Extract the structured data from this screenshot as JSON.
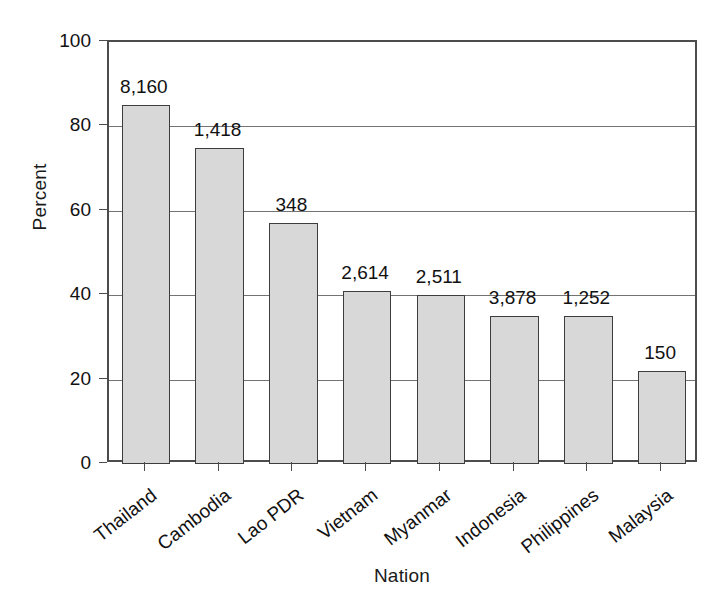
{
  "chart_data": {
    "type": "bar",
    "title": "",
    "subtitle": "",
    "xlabel": "Nation",
    "ylabel": "Percent",
    "categories": [
      "Thailand",
      "Cambodia",
      "Lao PDR",
      "Vietnam",
      "Myanmar",
      "Indonesia",
      "Philippines",
      "Malaysia"
    ],
    "values": [
      85,
      75,
      57,
      41,
      40,
      35,
      35,
      22
    ],
    "point_labels": [
      "8,160",
      "1,418",
      "348",
      "2,614",
      "2,511",
      "3,878",
      "1,252",
      "150"
    ],
    "ylim": [
      0,
      100
    ],
    "yticks": [
      0,
      20,
      40,
      60,
      80,
      100
    ],
    "ytick_labels": [
      "0",
      "20",
      "40",
      "60",
      "80",
      "100"
    ],
    "grid": "horizontal",
    "legend": "none",
    "bar_fill_color": "#d8d8d8",
    "bar_edge_color": "#3d3d3d",
    "grid_color": "#737373",
    "axis_color": "#4c4c4c",
    "text_color": "#111111"
  }
}
